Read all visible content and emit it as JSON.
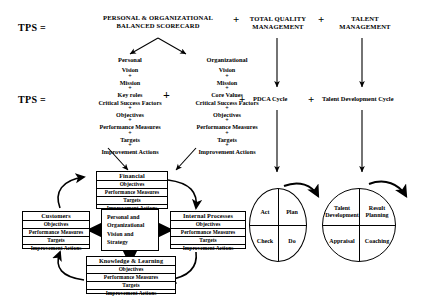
{
  "equation": {
    "tps_label_top": "TPS =",
    "tps_label_mid": "TPS =",
    "plus1": "+",
    "plus2": "+",
    "plus_mid1": "+",
    "plus_mid2": "+",
    "plus_columns": "+",
    "header_bsc_line1": "PERSONAL & ORGANIZATIONAL",
    "header_bsc_line2": "BALANCED SCORECARD",
    "header_tqm_line1": "TOTAL QUALITY",
    "header_tqm_line2": "MANAGEMENT",
    "header_tm_line1": "TALENT",
    "header_tm_line2": "MANAGEMENT",
    "pdca_cycle": "PDCA Cycle",
    "talent_cycle": "Talent Development Cycle"
  },
  "columns": {
    "personal": {
      "heading": "Personal",
      "items": [
        "Vision",
        "Mission",
        "Key roles",
        "Critical Success Factors",
        "Objectives",
        "Performance Measures",
        "Targets",
        "Improvement Actions"
      ],
      "plus": "+"
    },
    "organizational": {
      "heading": "Organizational",
      "items": [
        "Vision",
        "Mission",
        "Core Values",
        "Critical Success Factors",
        "Objectives",
        "Performance Measures",
        "Targets",
        "Improvement Actions"
      ],
      "plus": "+"
    }
  },
  "scorecard": {
    "center": {
      "line1": "Personal and",
      "line2": "Organizational",
      "line3": "Vision and",
      "line4": "Strategy"
    },
    "rows": [
      "Objectives",
      "Performance Measures",
      "Targets",
      "Improvement Actions"
    ],
    "financial": {
      "title": "Financial"
    },
    "customers": {
      "title": "Customers"
    },
    "internal": {
      "title": "Internal Processes"
    },
    "knowledge": {
      "title": "Knowledge & Learning"
    }
  },
  "pdca_circle": {
    "top_left": "Act",
    "top_right": "Plan",
    "bottom_left": "Check",
    "bottom_right": "Do"
  },
  "talent_circle": {
    "top_left_line1": "Talent",
    "top_left_line2": "Development",
    "top_right_line1": "Result",
    "top_right_line2": "Planning",
    "bottom_left": "Appraisal",
    "bottom_right": "Coaching"
  },
  "colors": {
    "ink": "#000000",
    "paper": "#ffffff"
  }
}
